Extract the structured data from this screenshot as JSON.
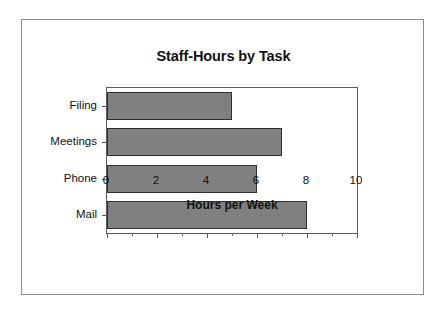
{
  "chart_data": {
    "type": "bar",
    "orientation": "horizontal",
    "title": "Staff-Hours by Task",
    "xlabel": "Hours per Week",
    "ylabel": "",
    "categories": [
      "Filing",
      "Meetings",
      "Phone",
      "Mail"
    ],
    "values": [
      5,
      7,
      6,
      8
    ],
    "series": [
      {
        "name": "Staff-Hours",
        "values": [
          5,
          7,
          6,
          8
        ]
      }
    ],
    "xlim": [
      0,
      10
    ],
    "xticks": [
      0,
      2,
      4,
      6,
      8,
      10
    ],
    "xtick_labels": [
      "0",
      "2",
      "4",
      "6",
      "8",
      "10"
    ],
    "xminor_ticks": [
      1,
      3,
      5,
      7,
      9
    ],
    "grid": false,
    "legend": false,
    "bar_color": "#808080",
    "bar_edge_color": "#2f2f2f",
    "plot_border_color": "#5a5a5a",
    "frame_border_color": "#8c8c8c",
    "background_color": "#ffffff",
    "text_color": "#111111"
  }
}
